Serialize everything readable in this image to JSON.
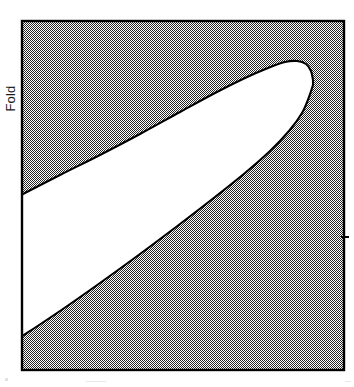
{
  "figure": {
    "kind": "catastrophe-fold-region-diagram",
    "axis_label_vertical": "Fold",
    "frame": {
      "x": 21,
      "y": 20,
      "width": 324,
      "height": 351,
      "stroke_color": "#000000",
      "stroke_width": 2
    },
    "background_fill": {
      "name": "dither-checkerboard-gray",
      "color": "#808080",
      "pattern": "1px black/white checkerboard"
    },
    "region_fill": {
      "name": "white-fold-region",
      "color": "#ffffff"
    },
    "right_tick": {
      "x": 345,
      "y": 237,
      "length": 8,
      "color": "#000000"
    }
  },
  "chart_data": {
    "type": "area",
    "title": "",
    "subtitle": "",
    "xlabel": "",
    "ylabel": "Fold",
    "legend": [],
    "annotations": [],
    "grid": false,
    "axis_ticks": {
      "x": [],
      "y": []
    },
    "xlim": [
      21,
      345
    ],
    "ylim": [
      371,
      20
    ],
    "series": [
      {
        "name": "fold-region-upper-boundary",
        "points": [
          [
            21,
            195
          ],
          [
            60,
            175
          ],
          [
            100,
            155
          ],
          [
            140,
            134
          ],
          [
            180,
            112
          ],
          [
            215,
            93
          ],
          [
            245,
            78
          ],
          [
            268,
            68
          ],
          [
            285,
            62
          ],
          [
            297,
            61
          ],
          [
            306,
            64
          ],
          [
            311,
            71
          ],
          [
            313,
            80
          ]
        ]
      },
      {
        "name": "fold-region-lower-boundary",
        "points": [
          [
            21,
            337
          ],
          [
            60,
            311
          ],
          [
            100,
            283
          ],
          [
            140,
            254
          ],
          [
            180,
            224
          ],
          [
            215,
            197
          ],
          [
            245,
            173
          ],
          [
            270,
            151
          ],
          [
            289,
            131
          ],
          [
            302,
            113
          ],
          [
            309,
            97
          ],
          [
            313,
            85
          ]
        ]
      }
    ],
    "nose_apex": [
      297,
      61
    ],
    "left_edge_contacts": [
      [
        21,
        195
      ],
      [
        21,
        337
      ]
    ]
  }
}
